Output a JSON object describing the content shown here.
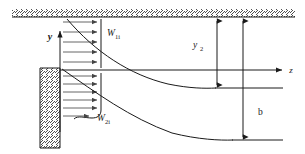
{
  "figure": {
    "background_color": "#ffffff",
    "line_color": "#1a1a1a",
    "hatch_color": "#3c3c3c",
    "profile_arrow_color": "#555555"
  },
  "axes": {
    "y_axis": {
      "label": "y",
      "direction": "up",
      "x_px": 60,
      "tip_y_px": 29,
      "base_y_px": 132
    },
    "z_axis": {
      "label": "z",
      "direction": "right",
      "y_px": 70,
      "start_x_px": 60,
      "tip_x_px": 287
    },
    "origin_px": [
      60,
      70
    ]
  },
  "boundaries": {
    "top_wall": {
      "name": "top-hatched-wall",
      "y_px": 17,
      "x_start_px": 12,
      "x_end_px": 295,
      "hatch_height_px": 8,
      "hatch_direction": "forward-slash"
    },
    "left_wall": {
      "name": "left-hatched-wall",
      "x_px": 40,
      "x_width_px": 20,
      "y_start_px": 68,
      "y_end_px": 148,
      "hatch_direction": "forward-slash"
    }
  },
  "profiles": [
    {
      "id": "upper",
      "label": "W",
      "label_subscript": "1i",
      "label_x_px": 107,
      "label_y_px": 34,
      "region": "above-z-axis",
      "base_x_px": 63,
      "tip_x_px": 101,
      "arrow_count": 5,
      "y_top_px": 19,
      "y_bottom_px": 68
    },
    {
      "id": "lower",
      "label": "W",
      "label_subscript": "2i",
      "label_x_px": 98,
      "label_y_px": 119,
      "region": "below-z-axis",
      "base_x_px": 63,
      "tip_x_px": 101,
      "arrow_count": 6,
      "y_top_px": 73,
      "y_bottom_px": 114
    }
  ],
  "curves": [
    {
      "id": "upper-shear-layer",
      "from_px": [
        67,
        19
      ],
      "to_px": [
        215,
        88
      ],
      "flat_level_y_px": 88
    },
    {
      "id": "lower-shear-layer",
      "from_px": [
        62,
        69
      ],
      "to_px": [
        232,
        140
      ],
      "flat_level_y_px": 140
    }
  ],
  "dimensions": [
    {
      "id": "y2",
      "label": "y",
      "label_subscript": "2",
      "label_x_px": 196,
      "label_y_px": 45,
      "line_x_px": 217,
      "top_y_px": 18,
      "bottom_y_px": 88,
      "arrow_ends": "both"
    },
    {
      "id": "b",
      "label": "b",
      "label_subscript": "",
      "label_x_px": 258,
      "label_y_px": 112,
      "line_x_px": 243,
      "top_y_px": 18,
      "bottom_y_px": 140,
      "arrow_ends": "both"
    }
  ],
  "reference_lines": [
    {
      "id": "upper-flat-level",
      "y_px": 88,
      "x_start_px": 215,
      "x_end_px": 283
    },
    {
      "id": "lower-flat-level",
      "y_px": 140,
      "x_start_px": 232,
      "x_end_px": 283
    }
  ]
}
